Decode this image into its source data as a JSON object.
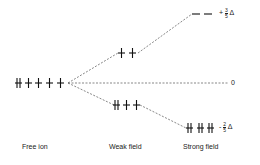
{
  "diagram": {
    "columns": [
      {
        "label": "Free ion"
      },
      {
        "label": "Weak field"
      },
      {
        "label": "Strong field"
      }
    ],
    "levels": {
      "free_ion": {
        "orbitals": [
          "paired",
          "up",
          "up",
          "up",
          "up"
        ]
      },
      "weak_eg": {
        "orbitals": [
          "up",
          "up"
        ]
      },
      "weak_t2g": {
        "orbitals": [
          "paired",
          "up",
          "up"
        ]
      },
      "strong_eg": {
        "orbitals": [
          "empty",
          "empty"
        ]
      },
      "strong_t2g": {
        "orbitals": [
          "paired",
          "paired",
          "paired"
        ]
      }
    },
    "energy_labels": {
      "upper_sign": "+",
      "upper_num": "3",
      "upper_den": "5",
      "upper_symbol": "Δ",
      "zero": "0",
      "lower_sign": "-",
      "lower_num": "2",
      "lower_den": "5",
      "lower_symbol": "Δ"
    },
    "colors": {
      "ink": "#111111",
      "dash": "#555555",
      "background": "#ffffff"
    }
  }
}
